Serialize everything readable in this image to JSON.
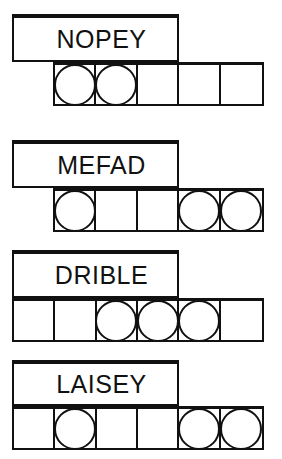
{
  "puzzle": {
    "stroke_color": "#111111",
    "background_color": "#ffffff",
    "rows": [
      {
        "word": "NOPEY",
        "label_left": 12,
        "label_top": 14,
        "label_width": 167,
        "label_height": 48,
        "strip_left": 53,
        "strip_top": 62,
        "strip_width": 211,
        "strip_height": 44,
        "cell_count": 5,
        "tokens": [
          1,
          1,
          0,
          0,
          0
        ],
        "token_count": 2
      },
      {
        "word": "MEFAD",
        "label_left": 12,
        "label_top": 140,
        "label_width": 167,
        "label_height": 48,
        "strip_left": 53,
        "strip_top": 188,
        "strip_width": 211,
        "strip_height": 44,
        "cell_count": 5,
        "tokens": [
          1,
          0,
          0,
          1,
          1
        ],
        "token_count": 3
      },
      {
        "word": "DRIBLE",
        "label_left": 12,
        "label_top": 250,
        "label_width": 167,
        "label_height": 48,
        "strip_left": 12,
        "strip_top": 298,
        "strip_width": 252,
        "strip_height": 44,
        "cell_count": 6,
        "tokens": [
          0,
          0,
          1,
          1,
          1,
          0
        ],
        "token_count": 3
      },
      {
        "word": "LAISEY",
        "label_left": 12,
        "label_top": 360,
        "label_width": 167,
        "label_height": 46,
        "strip_left": 12,
        "strip_top": 406,
        "strip_width": 252,
        "strip_height": 44,
        "cell_count": 6,
        "tokens": [
          0,
          1,
          0,
          0,
          1,
          1
        ],
        "token_count": 3
      }
    ]
  }
}
